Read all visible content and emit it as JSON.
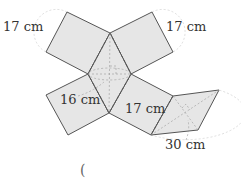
{
  "figure": {
    "type": "geometric-net",
    "labels": {
      "top_left_edge": "17 cm",
      "top_right_edge": "17 cm",
      "rhombus_diagonal": "16 cm",
      "lower_right_edge": "17 cm",
      "right_rhombus_diagonal": "30 cm"
    },
    "answer_paren": "("
  },
  "colors": {
    "face_fill": "#e6e6e6",
    "stroke": "#555555",
    "label": "#333333"
  }
}
